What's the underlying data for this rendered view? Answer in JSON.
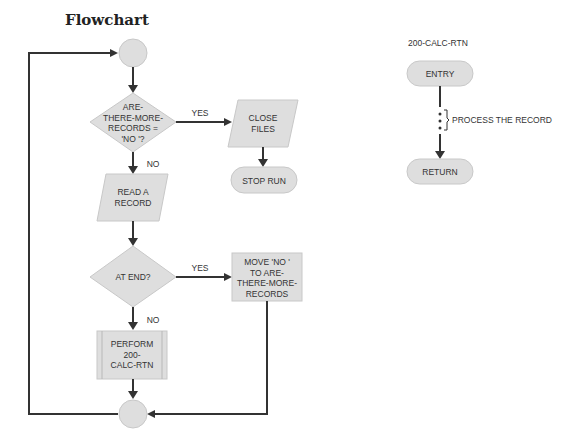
{
  "title": "Flowchart",
  "colors": {
    "shape_fill": "#dedede",
    "shape_stroke": "#c8c8c8",
    "line": "#333333",
    "background": "#ffffff"
  },
  "main_flow": {
    "start_connector": "",
    "decision_more_records": "ARE-\nTHERE-MORE-\nRECORDS =\n'NO '?",
    "yes_label_1": "YES",
    "no_label_1": "NO",
    "close_files": "CLOSE\nFILES",
    "stop_run": "STOP RUN",
    "read_record": "READ A\nRECORD",
    "decision_at_end": "AT END?",
    "yes_label_2": "YES",
    "no_label_2": "NO",
    "move_no": "MOVE 'NO '\nTO ARE-\nTHERE-MORE-\nRECORDS",
    "perform": "PERFORM\n200-\nCALC-RTN",
    "end_connector": ""
  },
  "subroutine": {
    "name": "200-CALC-RTN",
    "entry": "ENTRY",
    "process_note": "PROCESS THE RECORD",
    "return": "RETURN"
  }
}
